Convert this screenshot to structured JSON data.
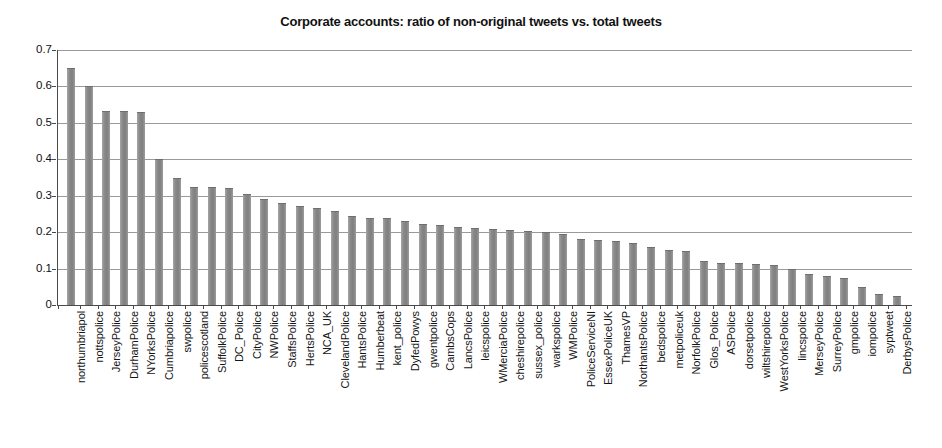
{
  "chart_data": {
    "type": "bar",
    "title": "Corporate accounts: ratio of non-original tweets vs. total tweets",
    "xlabel": "",
    "ylabel": "",
    "ylim": [
      0,
      0.7
    ],
    "ytick_labels": [
      "0.7",
      "0.6",
      "0.5",
      "0.4",
      "0.3",
      "0.2",
      "0.1",
      "0"
    ],
    "ytick_values": [
      0.7,
      0.6,
      0.5,
      0.4,
      0.3,
      0.2,
      0.1,
      0
    ],
    "grid": true,
    "legend": null,
    "bar_color": "#8a8a8a",
    "categories": [
      "northumbriapol",
      "nottspolice",
      "JerseyPolice",
      "DurhamPolice",
      "NYorksPolice",
      "Cumbriapolice",
      "swpolice",
      "policescotland",
      "SuffolkPolice",
      "DC_Police",
      "CityPolice",
      "NWPolice",
      "StaffsPolice",
      "HertsPolice",
      "NCA_UK",
      "ClevelandPolice",
      "HantsPolice",
      "Humberbeat",
      "kent_police",
      "DyfedPowys",
      "gwentpolice",
      "CambsCops",
      "LancsPolice",
      "leicspolice",
      "WMerciaPolice",
      "cheshirepolice",
      "sussex_police",
      "warkspolice",
      "WMPolice",
      "PoliceServiceNI",
      "EssexPoliceUK",
      "ThamesVP",
      "NorthantsPolice",
      "bedspolice",
      "metpoliceuk",
      "NorfolkPolice",
      "Glos_Police",
      "ASPolice",
      "dorsetpolice",
      "wiltshirepolice",
      "WestYorksPolice",
      "lincspolice",
      "MerseyPolice",
      "SurreyPolice",
      "gmpolice",
      "iompolice",
      "syptweet",
      "DerbysPolice"
    ],
    "values": [
      0.651,
      0.6,
      0.533,
      0.532,
      0.53,
      0.4,
      0.348,
      0.325,
      0.323,
      0.32,
      0.305,
      0.29,
      0.28,
      0.272,
      0.265,
      0.258,
      0.243,
      0.24,
      0.238,
      0.232,
      0.222,
      0.22,
      0.215,
      0.212,
      0.208,
      0.206,
      0.203,
      0.2,
      0.196,
      0.18,
      0.178,
      0.175,
      0.17,
      0.158,
      0.152,
      0.148,
      0.12,
      0.115,
      0.114,
      0.112,
      0.11,
      0.1,
      0.085,
      0.08,
      0.075,
      0.05,
      0.03,
      0.025
    ]
  }
}
